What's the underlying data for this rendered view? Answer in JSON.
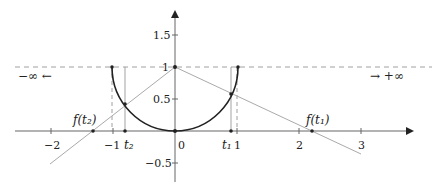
{
  "diagram": {
    "title": "",
    "colors": {
      "axis": "#666666",
      "curve": "#222222",
      "projection_line": "#aaaaaa",
      "dashed": "#888888",
      "point": "#222222",
      "text": "#222222"
    },
    "x_axis": {
      "ticks": [
        {
          "value": -2,
          "label": "−2"
        },
        {
          "value": -1,
          "label": "−1"
        },
        {
          "value": 0,
          "label": "0"
        },
        {
          "value": 1,
          "label": "1"
        },
        {
          "value": 2,
          "label": "2"
        },
        {
          "value": 3,
          "label": "3"
        }
      ]
    },
    "y_axis": {
      "ticks": [
        {
          "value": 1.5,
          "label": "1.5"
        },
        {
          "value": 1,
          "label": "1"
        },
        {
          "value": 0.5,
          "label": "0.5"
        },
        {
          "value": -0.5,
          "label": "−0.5"
        }
      ]
    },
    "labels": {
      "neg_inf": "−∞  ←",
      "pos_inf": "→  +∞",
      "f_t1": "f(t₁)",
      "f_t2": "f(t₂)",
      "t1": "t₁",
      "t2": "t₂"
    },
    "points": {
      "projection_center": [
        0,
        1
      ],
      "t1": 0.9,
      "t2": -0.8,
      "f_t1": 2.2,
      "f_t2": -1.32
    }
  }
}
